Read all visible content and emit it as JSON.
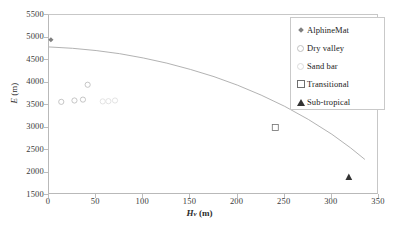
{
  "chart_data": {
    "type": "scatter",
    "title": "",
    "xlabel": "Hv (m)",
    "ylabel": "E (m)",
    "xlim": [
      0,
      350
    ],
    "ylim": [
      1500,
      5500
    ],
    "xticks": [
      0,
      50,
      100,
      150,
      200,
      250,
      300,
      350
    ],
    "yticks": [
      1500,
      2000,
      2500,
      3000,
      3500,
      4000,
      4500,
      5000,
      5500
    ],
    "grid": false,
    "legend_position": "top-right",
    "series": [
      {
        "name": "AlphineMat",
        "marker": "filled-diamond",
        "color": "#808080",
        "points": [
          {
            "x": 2,
            "y": 4950
          }
        ]
      },
      {
        "name": "Dry valley",
        "marker": "open-circle",
        "color": "#b8b8b8",
        "points": [
          {
            "x": 13,
            "y": 3570
          },
          {
            "x": 27,
            "y": 3600
          },
          {
            "x": 36,
            "y": 3620
          },
          {
            "x": 41,
            "y": 3950
          }
        ]
      },
      {
        "name": "Sand bar",
        "marker": "open-circle-light",
        "color": "#dcdcdc",
        "points": [
          {
            "x": 57,
            "y": 3580
          },
          {
            "x": 63,
            "y": 3585
          },
          {
            "x": 70,
            "y": 3600
          }
        ]
      },
      {
        "name": "Transitional",
        "marker": "open-square",
        "color": "#6f6f6f",
        "points": [
          {
            "x": 240,
            "y": 3000
          }
        ]
      },
      {
        "name": "Sub-tropical",
        "marker": "filled-triangle",
        "color": "#333333",
        "points": [
          {
            "x": 318,
            "y": 1900
          }
        ]
      }
    ],
    "trendline": {
      "name": "fitted-curve",
      "color": "#a9a9a9",
      "points": [
        {
          "x": 0,
          "y": 4790
        },
        {
          "x": 25,
          "y": 4760
        },
        {
          "x": 50,
          "y": 4710
        },
        {
          "x": 75,
          "y": 4640
        },
        {
          "x": 100,
          "y": 4545
        },
        {
          "x": 125,
          "y": 4430
        },
        {
          "x": 150,
          "y": 4290
        },
        {
          "x": 175,
          "y": 4130
        },
        {
          "x": 200,
          "y": 3940
        },
        {
          "x": 225,
          "y": 3720
        },
        {
          "x": 250,
          "y": 3470
        },
        {
          "x": 275,
          "y": 3180
        },
        {
          "x": 300,
          "y": 2850
        },
        {
          "x": 320,
          "y": 2545
        },
        {
          "x": 335,
          "y": 2290
        }
      ]
    }
  },
  "axes": {
    "y_title_italic": "E",
    "y_title_unit": " (m)",
    "x_title_symbol": "H",
    "x_title_subscript": "v",
    "x_title_unit": " (m)"
  },
  "legend": {
    "items": [
      {
        "label": "AlphineMat",
        "marker": "filled-diamond"
      },
      {
        "label": "Dry valley",
        "marker": "open-circle"
      },
      {
        "label": "Sand bar",
        "marker": "open-circle-light"
      },
      {
        "label": "Transitional",
        "marker": "open-square"
      },
      {
        "label": "Sub-tropical",
        "marker": "filled-triangle"
      }
    ]
  },
  "colors": {
    "frame": "#b9b9b9",
    "trendline": "#a9a9a9",
    "text": "#2b2b2b"
  }
}
